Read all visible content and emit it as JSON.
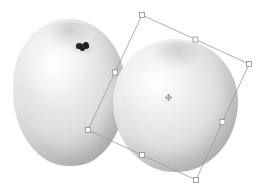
{
  "app": {
    "view": "image-canvas",
    "canvas": {
      "width": 261,
      "height": 190,
      "background": "#ffffff"
    },
    "tool": "free-transform"
  },
  "objects": [
    {
      "name": "fruit-left",
      "label": "Apple (back)",
      "bounds": {
        "x": 13,
        "y": 19,
        "width": 113,
        "height": 147
      },
      "fill_highlight": "#ffffff",
      "fill_mid": "#dcdcdc",
      "fill_shadow": "#9d9d9d",
      "stem_color": "#201f1f",
      "selected": false
    },
    {
      "name": "fruit-right",
      "label": "Apple (front)",
      "bounds": {
        "x": 113,
        "y": 39,
        "width": 125,
        "height": 133
      },
      "fill_highlight": "#ffffff",
      "fill_mid": "#e0e0e0",
      "fill_shadow": "#9f9f9f",
      "stem_color": "#201f1f",
      "selected": true
    }
  ],
  "transform_box": {
    "name": "free-transform-box",
    "stroke_color": "#9a9a9a",
    "stroke_width": 0.8,
    "handle_fill": "#ffffff",
    "handle_stroke": "#8c8c8c",
    "handle_size": 5,
    "rotation_deg": 26,
    "corners": {
      "top_left": {
        "x": 142,
        "y": 15
      },
      "top_right": {
        "x": 249,
        "y": 64
      },
      "bottom_right": {
        "x": 196,
        "y": 180
      },
      "bottom_left": {
        "x": 88,
        "y": 130
      }
    },
    "edge_handles": {
      "top": {
        "x": 195.5,
        "y": 39.5
      },
      "right": {
        "x": 222.5,
        "y": 122
      },
      "bottom": {
        "x": 142,
        "y": 155
      },
      "left": {
        "x": 115,
        "y": 72.5
      }
    },
    "pivot": {
      "name": "rotation-pivot",
      "x": 168.5,
      "y": 97.5,
      "size": 7,
      "color": "#8c8c8c"
    }
  }
}
